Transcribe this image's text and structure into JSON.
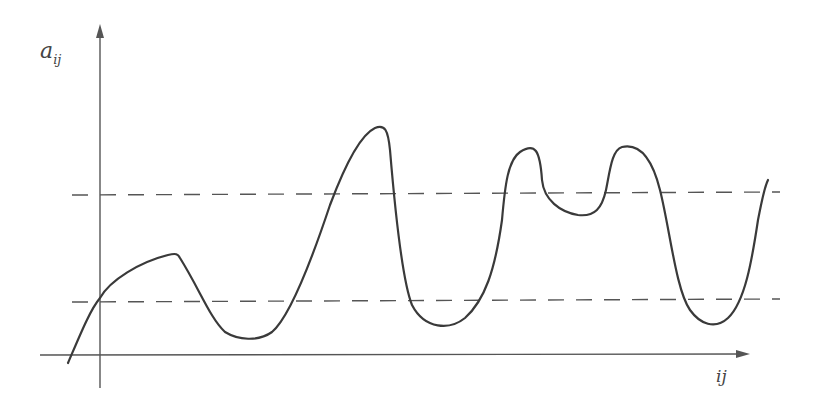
{
  "diagram": {
    "y_axis_label": {
      "base": "a",
      "subscript": "ij"
    },
    "x_axis_label": "ij",
    "colors": {
      "axis": "#555555",
      "curve": "#3a3a3a",
      "background": "#ffffff"
    },
    "threshold_lines": [
      {
        "name": "upper-threshold",
        "style": "dashed"
      },
      {
        "name": "lower-threshold",
        "style": "dashed"
      }
    ],
    "curve_description": "Wavy curve starting below x-axis, rising through lower threshold at the y-axis to a small plateau peak, dipping to a trough near baseline, climbing to a tall peak above upper threshold, dropping to a trough, then a double-humped plateau above upper threshold, dropping to a trough and rising steeply at the right edge"
  }
}
